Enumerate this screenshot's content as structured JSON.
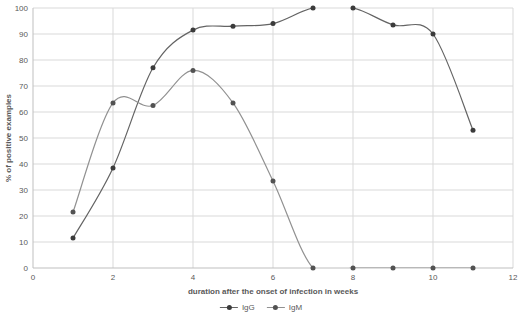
{
  "chart_data": {
    "type": "line",
    "x": [
      1,
      2,
      3,
      4,
      5,
      6,
      7,
      8,
      9,
      10,
      11
    ],
    "series": [
      {
        "name": "IgG",
        "line_color": "#646464",
        "marker_color": "#3b3b3b",
        "values": [
          11.5,
          38.5,
          77,
          91.5,
          93,
          94,
          100,
          100,
          93.5,
          90,
          53
        ]
      },
      {
        "name": "IgM",
        "line_color": "#919191",
        "marker_color": "#525252",
        "values": [
          21.5,
          63.5,
          62.5,
          76,
          63.5,
          33.5,
          0,
          0,
          0,
          0,
          0
        ]
      }
    ],
    "title": "",
    "xlabel": "duration after the onset of infection in weeks",
    "ylabel": "% of positive examples",
    "xlim": [
      0,
      12
    ],
    "ylim": [
      0,
      100
    ],
    "x_ticks": [
      0,
      2,
      4,
      6,
      8,
      10,
      12
    ],
    "y_ticks": [
      0,
      10,
      20,
      30,
      40,
      50,
      60,
      70,
      80,
      90,
      100
    ],
    "grid": true,
    "smooth": true,
    "legend_position": "bottom"
  },
  "colors": {
    "background": "#ffffff",
    "gridline": "#d9d9d9",
    "axis_line": "#bfbfbf",
    "text": "#595959"
  }
}
